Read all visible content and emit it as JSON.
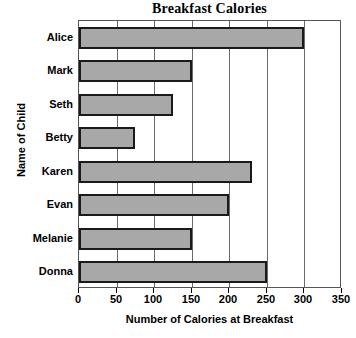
{
  "chart_data": {
    "type": "bar",
    "orientation": "horizontal",
    "title": "Breakfast Calories",
    "xlabel": "Number of Calories at Breakfast",
    "ylabel": "Name of Child",
    "categories": [
      "Alice",
      "Mark",
      "Seth",
      "Betty",
      "Karen",
      "Evan",
      "Melanie",
      "Donna"
    ],
    "values": [
      300,
      150,
      125,
      75,
      230,
      200,
      150,
      250
    ],
    "xlim": [
      0,
      350
    ],
    "xticks": [
      0,
      50,
      100,
      150,
      200,
      250,
      300,
      350
    ],
    "xtick_labels": [
      "0",
      "50",
      "100",
      "150",
      "200",
      "250",
      "300",
      "350"
    ],
    "grid": "vertical",
    "legend": null,
    "bar_fill_color": "#a8a8a8",
    "bar_border_color": "#1a1a1a",
    "plot_border_color": "#555555",
    "gridline_color": "#6a6a6a",
    "background_color": "#ffffff",
    "text_color": "#000000"
  }
}
